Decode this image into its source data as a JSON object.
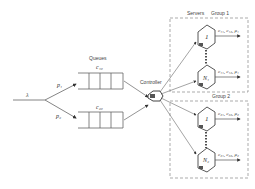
{
  "diagram": {
    "arrival": {
      "symbol": "λ"
    },
    "routing": [
      {
        "symbol": "p₁"
      },
      {
        "symbol": "p₂"
      }
    ],
    "queues": {
      "title": "Queues",
      "items": [
        {
          "label": "c₁₀"
        },
        {
          "label": "c₂₀"
        }
      ]
    },
    "controller": {
      "label": "Controller"
    },
    "servers_title": "Servers",
    "groups": [
      {
        "label": "Group 1",
        "servers": [
          {
            "id": "1",
            "output": "c₁₁, c₁₂, μ₁"
          },
          {
            "id": "N₁",
            "output": "c₁₁, c₁₂, μ₁"
          }
        ]
      },
      {
        "label": "Group 2",
        "servers": [
          {
            "id": "1",
            "output": "c₂₁, c₂₂, μ₂"
          },
          {
            "id": "N₂",
            "output": "c₂₁, c₂₂, μ₂"
          }
        ]
      }
    ],
    "colors": {
      "line": "#555555",
      "dash": "#888888",
      "text": "#333333"
    }
  }
}
